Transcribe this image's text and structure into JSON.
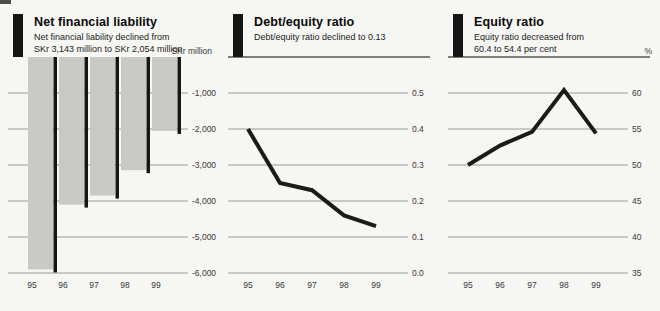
{
  "style": {
    "background": "#f6f6f3",
    "bar_fill": "#c9c9c6",
    "accent_black": "#161616",
    "line_color": "#1b1b1b",
    "grid_color": "#8f8f8f",
    "rule_color": "#555555",
    "label_color": "#3a3a3a",
    "title_color": "#0a0a0a"
  },
  "chart_data": [
    {
      "type": "bar",
      "title": "Net financial liability",
      "subtitle_line1": "Net financial liability declined from",
      "subtitle_line2": "SKr 3,143 million to SKr 2,054 million",
      "xlabel": "",
      "ylabel": "SKr million",
      "categories": [
        "95",
        "96",
        "97",
        "98",
        "99"
      ],
      "values": [
        -5900,
        -4100,
        -3850,
        -3143,
        -2054
      ],
      "ylim": [
        -6000,
        0
      ],
      "yticks": [
        -1000,
        -2000,
        -3000,
        -4000,
        -5000,
        -6000
      ],
      "ytick_labels": [
        "-1,000",
        "-2,000",
        "-3,000",
        "-4,000",
        "-5,000",
        "-6,000"
      ],
      "grid": true,
      "top_rule": false,
      "legend": "none"
    },
    {
      "type": "line",
      "title": "Debt/equity ratio",
      "subtitle_line1": "Debt/equity ratio declined to 0.13",
      "subtitle_line2": "",
      "xlabel": "",
      "ylabel": "",
      "categories": [
        "95",
        "96",
        "97",
        "98",
        "99"
      ],
      "values": [
        0.4,
        0.25,
        0.23,
        0.16,
        0.13
      ],
      "ylim": [
        0.0,
        0.6
      ],
      "yticks": [
        0.5,
        0.4,
        0.3,
        0.2,
        0.1,
        0.0
      ],
      "ytick_labels": [
        "0.5",
        "0.4",
        "0.3",
        "0.2",
        "0.1",
        "0.0"
      ],
      "grid": true,
      "top_rule": true,
      "legend": "none"
    },
    {
      "type": "line",
      "title": "Equity ratio",
      "subtitle_line1": "Equity ratio decreased from",
      "subtitle_line2": "60.4 to 54.4 per cent",
      "xlabel": "",
      "ylabel": "%",
      "categories": [
        "95",
        "96",
        "97",
        "98",
        "99"
      ],
      "values": [
        50.0,
        52.7,
        54.6,
        60.4,
        54.4
      ],
      "ylim": [
        35,
        65
      ],
      "yticks": [
        60,
        55,
        50,
        45,
        40,
        35
      ],
      "ytick_labels": [
        "60",
        "55",
        "50",
        "45",
        "40",
        "35"
      ],
      "grid": true,
      "top_rule": true,
      "legend": "none"
    }
  ]
}
